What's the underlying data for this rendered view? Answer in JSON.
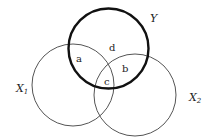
{
  "diagram": {
    "type": "venn",
    "sets": [
      {
        "id": "X1",
        "label": "X",
        "subscript": "1",
        "cx": 73,
        "cy": 85,
        "r": 41,
        "style": "thin"
      },
      {
        "id": "X2",
        "label": "X",
        "subscript": "2",
        "cx": 135,
        "cy": 95,
        "r": 41,
        "style": "thin"
      },
      {
        "id": "Y",
        "label": "Y",
        "subscript": "",
        "cx": 108.5,
        "cy": 48.5,
        "r": 40,
        "style": "thick"
      }
    ],
    "regions": [
      {
        "id": "a",
        "label": "a",
        "x": 79,
        "y": 62,
        "description": "X1 ∩ Y only"
      },
      {
        "id": "b",
        "label": "b",
        "x": 125,
        "y": 72,
        "description": "X2 ∩ Y only"
      },
      {
        "id": "c",
        "label": "c",
        "x": 107,
        "y": 85,
        "description": "X1 ∩ X2 ∩ Y"
      },
      {
        "id": "d",
        "label": "d",
        "x": 112,
        "y": 51,
        "description": "Y only"
      }
    ],
    "colors": {
      "thin_stroke": "#555555",
      "thick_stroke": "#111111",
      "text": "#222222",
      "background": "#ffffff"
    }
  }
}
